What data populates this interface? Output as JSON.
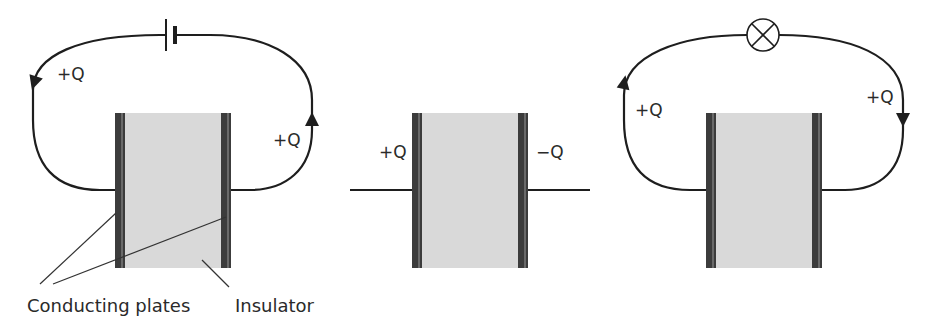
{
  "colors": {
    "wire": "#1e1e1e",
    "plate": "#3c3c3c",
    "plate_highlight": "#6a6a6a",
    "insulator": "#d9d9d9",
    "text": "#2a2a2a"
  },
  "diagrams": [
    {
      "id": "charging",
      "component": "battery",
      "labels": {
        "left_wire": "+Q",
        "right_wire": "+Q"
      },
      "arrows": [
        "left-wire-down",
        "right-wire-up"
      ]
    },
    {
      "id": "charged",
      "component": "none",
      "labels": {
        "left_plate": "+Q",
        "right_plate": "−Q"
      }
    },
    {
      "id": "discharging",
      "component": "lamp",
      "labels": {
        "left_wire": "+Q",
        "right_wire": "+Q"
      },
      "arrows": [
        "left-wire-up",
        "right-wire-down"
      ]
    }
  ],
  "captions": {
    "plates": "Conducting plates",
    "insulator": "Insulator"
  }
}
